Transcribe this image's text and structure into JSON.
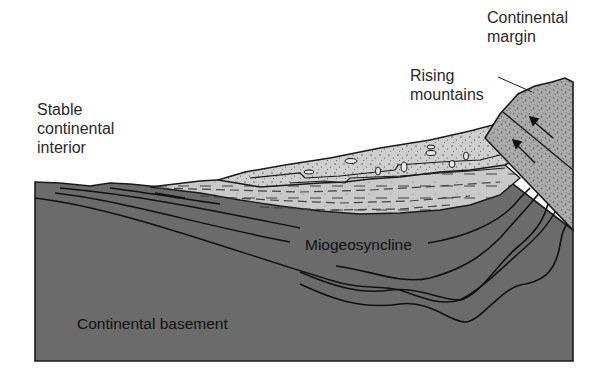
{
  "figure": {
    "type": "geologic cross-section",
    "colors": {
      "background": "#ffffff",
      "basement": "#6b6b6b",
      "sediment_fill": "#c8c8c8",
      "mountain_block": "#a9a9a9",
      "outline": "#1a1a1a",
      "text": "#2a2a2a"
    }
  },
  "labels": {
    "stable_interior": "Stable\ncontinental\ninterior",
    "continental_margin": "Continental\nmargin",
    "rising_mountains": "Rising\nmountains",
    "miogeosyncline": "Miogeosyncline",
    "continental_basement": "Continental basement"
  },
  "layers": [
    {
      "name": "Continental basement",
      "fill": "dark grey"
    },
    {
      "name": "Miogeosyncline strata",
      "fill": "dark grey, folded lines"
    },
    {
      "name": "Shale wedge",
      "fill": "light grey, dashed"
    },
    {
      "name": "Sandstone/conglomerate wedge",
      "fill": "light grey, stippled with pebbles"
    },
    {
      "name": "Rising mountains block",
      "fill": "medium grey, speckled, arrows indicating uplift"
    }
  ]
}
